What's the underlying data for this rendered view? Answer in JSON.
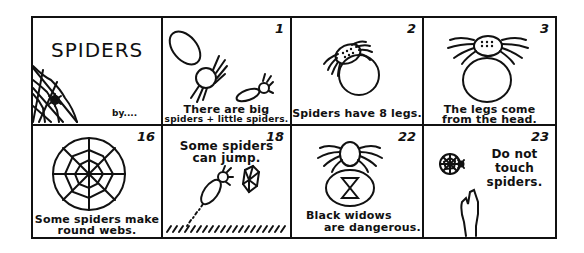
{
  "booklet": {
    "cover": {
      "title": "SPIDERS",
      "byline": "by...."
    },
    "panels": [
      {
        "number": "1",
        "caption_lines": [
          "There are big",
          "spiders + little spiders."
        ],
        "illustration": "big-and-little-spider"
      },
      {
        "number": "2",
        "caption_lines": [
          "Spiders have 8 legs."
        ],
        "illustration": "spider-eight-legs"
      },
      {
        "number": "3",
        "caption_lines": [
          "The legs come",
          "from the head."
        ],
        "illustration": "spider-legs-from-head"
      },
      {
        "number": "16",
        "caption_lines": [
          "Some spiders make",
          "round webs."
        ],
        "illustration": "round-web"
      },
      {
        "number": "18",
        "caption_lines": [
          "Some spiders",
          "can jump."
        ],
        "illustration": "jumping-spider"
      },
      {
        "number": "22",
        "caption_lines": [
          "Black widows",
          "are dangerous."
        ],
        "illustration": "black-widow-hourglass"
      },
      {
        "number": "23",
        "caption_lines": [
          "Do not",
          "touch",
          "spiders."
        ],
        "illustration": "hand-and-spider-web"
      }
    ]
  }
}
